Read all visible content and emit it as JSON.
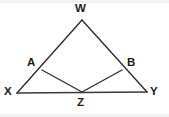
{
  "figure": {
    "type": "geometry-diagram",
    "canvas": {
      "width": 169,
      "height": 117,
      "background": "#ffffff"
    },
    "stroke_color": "#2b2b2b",
    "label_color": "#1a1a1a",
    "points": [
      {
        "id": "W",
        "label": "W",
        "x": 82,
        "y": 20,
        "label_x": 75,
        "label_y": 2
      },
      {
        "id": "A",
        "label": "A",
        "x": 42,
        "y": 70,
        "label_x": 27,
        "label_y": 56
      },
      {
        "id": "B",
        "label": "B",
        "x": 122,
        "y": 70,
        "label_x": 127,
        "label_y": 56
      },
      {
        "id": "X",
        "label": "X",
        "x": 17,
        "y": 93,
        "label_x": 4,
        "label_y": 85
      },
      {
        "id": "Y",
        "label": "Y",
        "x": 147,
        "y": 92,
        "label_x": 150,
        "label_y": 85
      },
      {
        "id": "Z",
        "label": "Z",
        "x": 82,
        "y": 92,
        "label_x": 77,
        "label_y": 96
      }
    ],
    "segments": [
      {
        "id": "WX",
        "from": "W",
        "to": "X",
        "style": "edge"
      },
      {
        "id": "WY",
        "from": "W",
        "to": "Y",
        "style": "edge"
      },
      {
        "id": "XY",
        "from": "X",
        "to": "Y",
        "style": "edge-base"
      },
      {
        "id": "AZ",
        "from": "A",
        "to": "Z",
        "style": "cevian"
      },
      {
        "id": "ZB",
        "from": "Z",
        "to": "B",
        "style": "cevian"
      }
    ]
  }
}
